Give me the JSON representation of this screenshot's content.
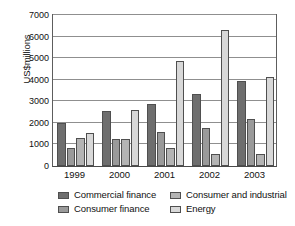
{
  "chart_data": {
    "type": "bar",
    "title": "",
    "xlabel": "",
    "ylabel": "US$millions",
    "categories": [
      "1999",
      "2000",
      "2001",
      "2002",
      "2003"
    ],
    "ylim": [
      0,
      7000
    ],
    "yticks": [
      0,
      1000,
      2000,
      3000,
      4000,
      5000,
      6000,
      7000
    ],
    "ytick_labels": [
      "0",
      "1000",
      "2000",
      "3000",
      "4000",
      "5000",
      "6000",
      "7000"
    ],
    "grid": true,
    "legend_position": "bottom",
    "series": [
      {
        "name": "Commercial finance",
        "color": "#6e6e6e",
        "values": [
          2010,
          2530,
          2880,
          3320,
          3930
        ]
      },
      {
        "name": "Consumer finance",
        "color": "#9a9a9a",
        "values": [
          830,
          1260,
          1570,
          1780,
          2160
        ]
      },
      {
        "name": "Consumer and industrial",
        "color": "#b4b4b4",
        "values": [
          1280,
          1240,
          830,
          550,
          570
        ]
      },
      {
        "name": "Energy",
        "color": "#d8d8d8",
        "values": [
          1550,
          2590,
          4870,
          6300,
          4120
        ]
      }
    ]
  },
  "legend": {
    "items": [
      {
        "label": "Commercial finance",
        "color": "#6e6e6e"
      },
      {
        "label": "Consumer and industrial",
        "color": "#b4b4b4"
      },
      {
        "label": "Consumer finance",
        "color": "#9a9a9a"
      },
      {
        "label": "Energy",
        "color": "#d8d8d8"
      }
    ]
  }
}
